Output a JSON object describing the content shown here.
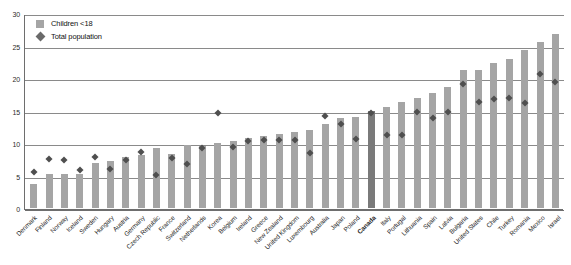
{
  "chart": {
    "title": "",
    "legend": {
      "position": "top-left",
      "entries": [
        {
          "label": "Children <18",
          "marker": "square",
          "color": "#a5a5a5"
        },
        {
          "label": "Total population",
          "marker": "diamond",
          "color": "#6a6a6a"
        }
      ]
    },
    "y_axis": {
      "ticks": [
        "0",
        "5",
        "10",
        "15",
        "20",
        "25",
        "30"
      ],
      "label": ""
    },
    "highlight_country": "Canada"
  },
  "chart_data": {
    "type": "bar",
    "title": "",
    "xlabel": "",
    "ylabel": "",
    "ylim": [
      0,
      30
    ],
    "yticks": [
      0,
      5,
      10,
      15,
      20,
      25,
      30
    ],
    "grid": true,
    "legend_position": "top-left",
    "highlight": "Canada",
    "categories": [
      "Denmark",
      "Finland",
      "Norway",
      "Iceland",
      "Sweden",
      "Hungary",
      "Austria",
      "Germany",
      "Czech Republic",
      "France",
      "Switzerland",
      "Netherlands",
      "Korea",
      "Belgium",
      "Ireland",
      "Greece",
      "New Zealand",
      "United Kingdom",
      "Luxembourg",
      "Australia",
      "Japan",
      "Poland",
      "Canada",
      "Italy",
      "Portugal",
      "Lithuania",
      "Spain",
      "Latvia",
      "Bulgaria",
      "United States",
      "Chile",
      "Turkey",
      "Romania",
      "Mexico",
      "Israel"
    ],
    "series": [
      {
        "name": "Children <18",
        "marker": "bar",
        "color": "#a5a5a5",
        "values": [
          3.7,
          5.2,
          5.3,
          5.3,
          6.9,
          7.2,
          7.8,
          8.1,
          9.2,
          8.3,
          9.7,
          9.6,
          10.0,
          10.3,
          10.8,
          11.1,
          11.4,
          11.7,
          12.0,
          13.0,
          13.9,
          14.0,
          15.0,
          15.5,
          16.3,
          17.0,
          17.7,
          18.6,
          21.3,
          21.2,
          22.3,
          23.0,
          24.3,
          25.6,
          26.7
        ]
      },
      {
        "name": "Total population",
        "marker": "diamond",
        "color": "#4f4f4f",
        "values": [
          6.0,
          8.0,
          7.8,
          6.3,
          8.3,
          6.4,
          7.8,
          9.0,
          5.5,
          8.1,
          7.2,
          9.6,
          15.0,
          9.8,
          10.7,
          10.8,
          10.9,
          10.8,
          8.9,
          14.5,
          13.3,
          11.0,
          15.0,
          11.6,
          11.6,
          15.1,
          14.3,
          15.1,
          19.5,
          16.7,
          17.1,
          17.3,
          16.6,
          21.0,
          19.8
        ]
      }
    ]
  }
}
